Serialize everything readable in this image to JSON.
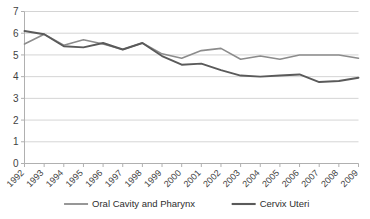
{
  "chart_data": {
    "type": "line",
    "title": "",
    "subtitle": "",
    "xlabel": "",
    "ylabel": "",
    "xlim": [
      1992,
      2009
    ],
    "ylim": [
      0,
      7
    ],
    "grid": true,
    "legend_position": "bottom",
    "categories": [
      "1992",
      "1993",
      "1994",
      "1995",
      "1996",
      "1997",
      "1998",
      "1999",
      "2000",
      "2001",
      "2002",
      "2003",
      "2004",
      "2005",
      "2006",
      "2007",
      "2008",
      "2009"
    ],
    "yticks": [
      "0",
      "1",
      "2",
      "3",
      "4",
      "5",
      "6",
      "7"
    ],
    "series": [
      {
        "name": "Oral Cavity and Pharynx",
        "color": "#8c8c8c",
        "values": [
          5.5,
          5.95,
          5.45,
          5.7,
          5.5,
          5.25,
          5.55,
          5.05,
          4.85,
          5.2,
          5.3,
          4.8,
          4.95,
          4.8,
          5.0,
          5.0,
          5.0,
          4.85
        ]
      },
      {
        "name": "Cervix Uteri",
        "color": "#5a5a5a",
        "values": [
          6.1,
          5.95,
          5.4,
          5.35,
          5.55,
          5.25,
          5.55,
          4.95,
          4.55,
          4.6,
          4.3,
          4.05,
          4.0,
          4.05,
          4.1,
          3.75,
          3.8,
          3.95
        ]
      }
    ]
  },
  "legend": {
    "items": [
      {
        "label": "Oral Cavity and Pharynx",
        "color": "#8c8c8c"
      },
      {
        "label": "Cervix Uteri",
        "color": "#5a5a5a"
      }
    ]
  }
}
